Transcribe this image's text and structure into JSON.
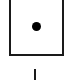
{
  "diagram": {
    "node": {
      "shape": "square",
      "border_color": "#1a1a1a",
      "fill_color": "#ffffff",
      "marker": "dot-icon",
      "marker_color": "#000000"
    },
    "connector": {
      "direction": "vertical",
      "color": "#1a1a1a"
    }
  }
}
